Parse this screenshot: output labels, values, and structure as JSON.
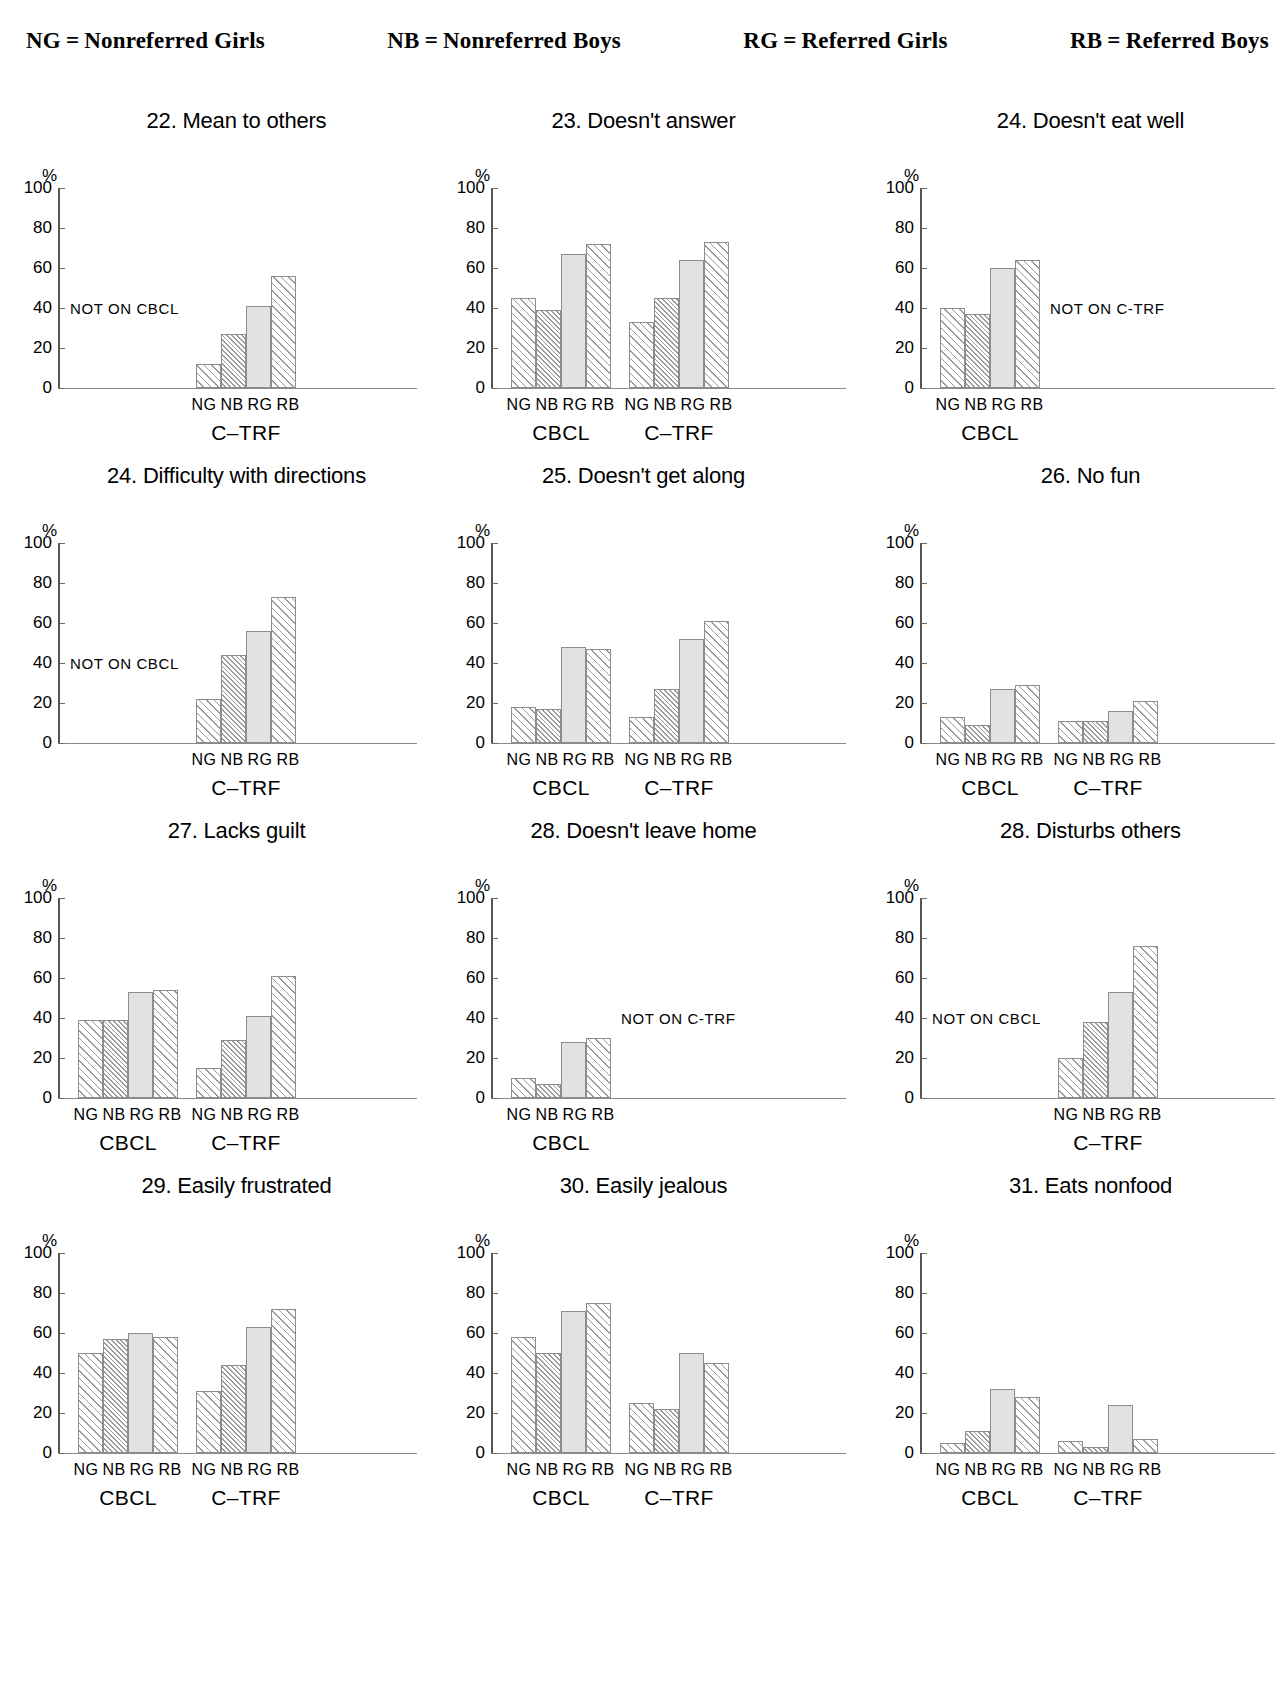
{
  "page": {
    "folio": "",
    "legend": [
      {
        "abbr": "NG",
        "eq": "=",
        "term": "Nonreferred Girls"
      },
      {
        "abbr": "NB",
        "eq": "=",
        "term": "Nonreferred Boys"
      },
      {
        "abbr": "RG",
        "eq": "=",
        "term": "Referred Girls"
      },
      {
        "abbr": "RB",
        "eq": "=",
        "term": "Referred Boys"
      }
    ]
  },
  "axis": {
    "unit": "%",
    "ticks": [
      "100",
      "80",
      "60",
      "40",
      "20",
      "0"
    ],
    "categories": [
      "NG",
      "NB",
      "RG",
      "RB"
    ],
    "instrument_cbcl": "CBCL",
    "instrument_ctrf": "C-TRF",
    "note_not_on_cbcl": "NOT ON CBCL",
    "note_not_on_ctrf": "NOT ON C-TRF"
  },
  "chart_data": [
    {
      "type": "bar",
      "title": "22. Mean to others",
      "ylabel": "%",
      "ylim": [
        0,
        100
      ],
      "yticks": [
        0,
        20,
        40,
        60,
        80,
        100
      ],
      "categories": [
        "NG",
        "NB",
        "RG",
        "RB"
      ],
      "groups": [
        {
          "name": "CBCL",
          "missing": true,
          "note": "NOT ON CBCL",
          "values": []
        },
        {
          "name": "C-TRF",
          "missing": false,
          "values": [
            12,
            27,
            41,
            56
          ]
        }
      ]
    },
    {
      "type": "bar",
      "title": "23. Doesn't answer",
      "ylabel": "%",
      "ylim": [
        0,
        100
      ],
      "yticks": [
        0,
        20,
        40,
        60,
        80,
        100
      ],
      "categories": [
        "NG",
        "NB",
        "RG",
        "RB"
      ],
      "groups": [
        {
          "name": "CBCL",
          "missing": false,
          "values": [
            45,
            39,
            67,
            72
          ]
        },
        {
          "name": "C-TRF",
          "missing": false,
          "values": [
            33,
            45,
            64,
            73
          ]
        }
      ]
    },
    {
      "type": "bar",
      "title": "24. Doesn't eat well",
      "ylabel": "%",
      "ylim": [
        0,
        100
      ],
      "yticks": [
        0,
        20,
        40,
        60,
        80,
        100
      ],
      "categories": [
        "NG",
        "NB",
        "RG",
        "RB"
      ],
      "groups": [
        {
          "name": "CBCL",
          "missing": false,
          "values": [
            40,
            37,
            60,
            64
          ]
        },
        {
          "name": "C-TRF",
          "missing": true,
          "note": "NOT ON C-TRF",
          "values": []
        }
      ]
    },
    {
      "type": "bar",
      "title": "24. Difficulty with directions",
      "ylabel": "%",
      "ylim": [
        0,
        100
      ],
      "yticks": [
        0,
        20,
        40,
        60,
        80,
        100
      ],
      "categories": [
        "NG",
        "NB",
        "RG",
        "RB"
      ],
      "groups": [
        {
          "name": "CBCL",
          "missing": true,
          "note": "NOT ON CBCL",
          "values": []
        },
        {
          "name": "C-TRF",
          "missing": false,
          "values": [
            22,
            44,
            56,
            73
          ]
        }
      ]
    },
    {
      "type": "bar",
      "title": "25. Doesn't get along",
      "ylabel": "%",
      "ylim": [
        0,
        100
      ],
      "yticks": [
        0,
        20,
        40,
        60,
        80,
        100
      ],
      "categories": [
        "NG",
        "NB",
        "RG",
        "RB"
      ],
      "groups": [
        {
          "name": "CBCL",
          "missing": false,
          "values": [
            18,
            17,
            48,
            47
          ]
        },
        {
          "name": "C-TRF",
          "missing": false,
          "values": [
            13,
            27,
            52,
            61
          ]
        }
      ]
    },
    {
      "type": "bar",
      "title": "26. No fun",
      "ylabel": "%",
      "ylim": [
        0,
        100
      ],
      "yticks": [
        0,
        20,
        40,
        60,
        80,
        100
      ],
      "categories": [
        "NG",
        "NB",
        "RG",
        "RB"
      ],
      "groups": [
        {
          "name": "CBCL",
          "missing": false,
          "values": [
            13,
            9,
            27,
            29
          ]
        },
        {
          "name": "C-TRF",
          "missing": false,
          "values": [
            11,
            11,
            16,
            21
          ]
        }
      ]
    },
    {
      "type": "bar",
      "title": "27. Lacks guilt",
      "ylabel": "%",
      "ylim": [
        0,
        100
      ],
      "yticks": [
        0,
        20,
        40,
        60,
        80,
        100
      ],
      "categories": [
        "NG",
        "NB",
        "RG",
        "RB"
      ],
      "groups": [
        {
          "name": "CBCL",
          "missing": false,
          "values": [
            39,
            39,
            53,
            54
          ]
        },
        {
          "name": "C-TRF",
          "missing": false,
          "values": [
            15,
            29,
            41,
            61
          ]
        }
      ]
    },
    {
      "type": "bar",
      "title": "28. Doesn't leave home",
      "ylabel": "%",
      "ylim": [
        0,
        100
      ],
      "yticks": [
        0,
        20,
        40,
        60,
        80,
        100
      ],
      "categories": [
        "NG",
        "NB",
        "RG",
        "RB"
      ],
      "groups": [
        {
          "name": "CBCL",
          "missing": false,
          "values": [
            10,
            7,
            28,
            30
          ]
        },
        {
          "name": "C-TRF",
          "missing": true,
          "note": "NOT ON C-TRF",
          "values": []
        }
      ]
    },
    {
      "type": "bar",
      "title": "28. Disturbs others",
      "ylabel": "%",
      "ylim": [
        0,
        100
      ],
      "yticks": [
        0,
        20,
        40,
        60,
        80,
        100
      ],
      "categories": [
        "NG",
        "NB",
        "RG",
        "RB"
      ],
      "groups": [
        {
          "name": "CBCL",
          "missing": true,
          "note": "NOT ON CBCL",
          "values": []
        },
        {
          "name": "C-TRF",
          "missing": false,
          "values": [
            20,
            38,
            53,
            76
          ]
        }
      ]
    },
    {
      "type": "bar",
      "title": "29. Easily frustrated",
      "ylabel": "%",
      "ylim": [
        0,
        100
      ],
      "yticks": [
        0,
        20,
        40,
        60,
        80,
        100
      ],
      "categories": [
        "NG",
        "NB",
        "RG",
        "RB"
      ],
      "groups": [
        {
          "name": "CBCL",
          "missing": false,
          "values": [
            50,
            57,
            60,
            58
          ]
        },
        {
          "name": "C-TRF",
          "missing": false,
          "values": [
            31,
            44,
            63,
            72
          ]
        }
      ]
    },
    {
      "type": "bar",
      "title": "30. Easily jealous",
      "ylabel": "%",
      "ylim": [
        0,
        100
      ],
      "yticks": [
        0,
        20,
        40,
        60,
        80,
        100
      ],
      "categories": [
        "NG",
        "NB",
        "RG",
        "RB"
      ],
      "groups": [
        {
          "name": "CBCL",
          "missing": false,
          "values": [
            58,
            50,
            71,
            75
          ]
        },
        {
          "name": "C-TRF",
          "missing": false,
          "values": [
            25,
            22,
            50,
            45
          ]
        }
      ]
    },
    {
      "type": "bar",
      "title": "31. Eats nonfood",
      "ylabel": "%",
      "ylim": [
        0,
        100
      ],
      "yticks": [
        0,
        20,
        40,
        60,
        80,
        100
      ],
      "categories": [
        "NG",
        "NB",
        "RG",
        "RB"
      ],
      "groups": [
        {
          "name": "CBCL",
          "missing": false,
          "values": [
            5,
            11,
            32,
            28
          ]
        },
        {
          "name": "C-TRF",
          "missing": false,
          "values": [
            6,
            3,
            24,
            7
          ]
        }
      ]
    }
  ]
}
